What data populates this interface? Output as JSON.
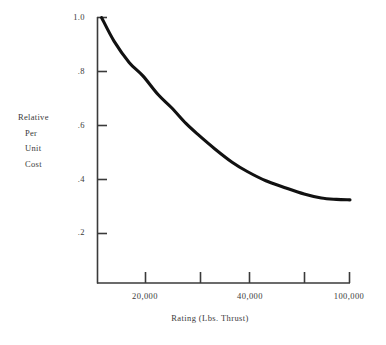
{
  "chart_data": {
    "type": "line",
    "title": "",
    "xlabel": "Rating (Lbs. Thrust)",
    "ylabel": "Relative Per Unit Cost",
    "ylabel_lines": [
      "Relative",
      "Per",
      "Unit",
      "Cost"
    ],
    "x_scale": "log",
    "xlim": [
      14000,
      100000
    ],
    "ylim": [
      0.0,
      1.0
    ],
    "grid": false,
    "legend": null,
    "y_ticks": [
      1.0,
      0.8,
      0.6,
      0.4,
      0.2
    ],
    "y_tick_labels": [
      "1.0",
      ".8",
      ".6",
      ".4",
      ".2"
    ],
    "x_ticks": [
      20000,
      30000,
      40000,
      60000,
      100000
    ],
    "x_tick_labels": [
      "20,000",
      "",
      "40,000",
      "",
      "100,000"
    ],
    "x_labeled_ticks": [
      {
        "value": 20000,
        "label": "20,000"
      },
      {
        "value": 40000,
        "label": "40,000"
      },
      {
        "value": 100000,
        "label": "100,000"
      }
    ],
    "series": [
      {
        "name": "Relative Per Unit Cost",
        "x": [
          14500,
          16000,
          18000,
          20000,
          22500,
          25000,
          28000,
          31000,
          35000,
          40000,
          45000,
          52000,
          60000,
          70000,
          80000,
          90000,
          100000
        ],
        "values": [
          1.0,
          0.91,
          0.83,
          0.78,
          0.71,
          0.66,
          0.6,
          0.555,
          0.505,
          0.455,
          0.42,
          0.385,
          0.36,
          0.335,
          0.32,
          0.315,
          0.313
        ]
      }
    ],
    "line_color": "#111111",
    "axis_color": "#3a3a3a"
  },
  "axes": {
    "y_label_lines": [
      "Relative",
      "Per",
      "Unit",
      "Cost"
    ],
    "x_title": "Rating (Lbs. Thrust)"
  },
  "y_tick_labels": [
    "1.0",
    ".8",
    ".6",
    ".4",
    ".2"
  ],
  "x_tick_labels": [
    "20,000",
    "40,000",
    "100,000"
  ]
}
